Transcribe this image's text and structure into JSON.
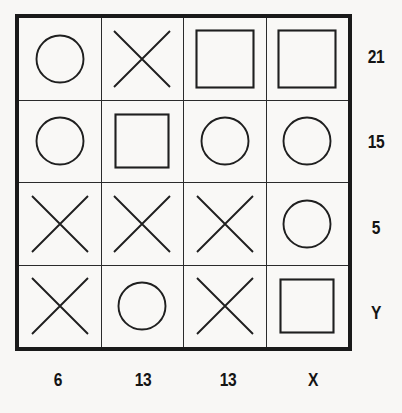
{
  "puzzle": {
    "type": "shape-grid-matrix",
    "rows": 4,
    "cols": 4,
    "background_color": "#f8f7f5",
    "line_color": "#1f1f1f",
    "border_color": "#1a1a1a",
    "cells": [
      [
        {
          "shape": "circle",
          "icon": "circle-icon"
        },
        {
          "shape": "cross",
          "icon": "cross-icon"
        },
        {
          "shape": "square",
          "icon": "square-icon"
        },
        {
          "shape": "square",
          "icon": "square-icon"
        }
      ],
      [
        {
          "shape": "circle",
          "icon": "circle-icon"
        },
        {
          "shape": "square",
          "icon": "square-icon"
        },
        {
          "shape": "circle",
          "icon": "circle-icon"
        },
        {
          "shape": "circle",
          "icon": "circle-icon"
        }
      ],
      [
        {
          "shape": "cross",
          "icon": "cross-icon"
        },
        {
          "shape": "cross",
          "icon": "cross-icon"
        },
        {
          "shape": "cross",
          "icon": "cross-icon"
        },
        {
          "shape": "circle",
          "icon": "circle-icon"
        }
      ],
      [
        {
          "shape": "cross",
          "icon": "cross-icon"
        },
        {
          "shape": "circle",
          "icon": "circle-icon"
        },
        {
          "shape": "cross",
          "icon": "cross-icon"
        },
        {
          "shape": "square",
          "icon": "square-icon"
        }
      ]
    ],
    "row_labels": [
      "21",
      "15",
      "5",
      "Y"
    ],
    "col_labels": [
      "6",
      "13",
      "13",
      "X"
    ]
  }
}
